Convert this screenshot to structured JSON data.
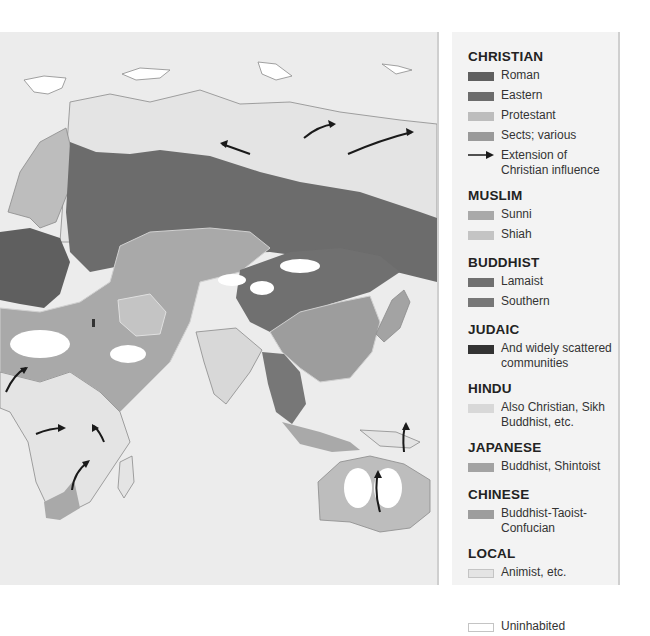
{
  "map": {
    "colors": {
      "ocean": "#ececec",
      "roman": "#5f5f5f",
      "eastern": "#6c6c6c",
      "protestant": "#bdbdbd",
      "sects": "#9a9a9a",
      "sunni": "#a9a9a9",
      "shiah": "#c4c4c4",
      "lamaist": "#707070",
      "southern": "#777777",
      "judaic": "#333333",
      "hindu": "#d8d8d8",
      "japanese": "#a3a3a3",
      "chinese": "#9d9d9d",
      "local": "#e4e4e4",
      "uninhabited": "#ffffff",
      "coast": "#8a8a8a",
      "arrow": "#1a1a1a"
    }
  },
  "legend": {
    "groups": [
      {
        "title": "CHRISTIAN",
        "items": [
          {
            "label": "Roman",
            "color": "#5f5f5f"
          },
          {
            "label": "Eastern",
            "color": "#6c6c6c"
          },
          {
            "label": "Protestant",
            "color": "#bdbdbd"
          },
          {
            "label": "Sects; various",
            "color": "#9a9a9a"
          },
          {
            "label": "Extension of Christian influence",
            "symbol": "arrow"
          }
        ]
      },
      {
        "title": "MUSLIM",
        "items": [
          {
            "label": "Sunni",
            "color": "#a9a9a9"
          },
          {
            "label": "Shiah",
            "color": "#c4c4c4"
          }
        ]
      },
      {
        "title": "BUDDHIST",
        "items": [
          {
            "label": "Lamaist",
            "color": "#707070"
          },
          {
            "label": "Southern",
            "color": "#777777"
          }
        ]
      },
      {
        "title": "JUDAIC",
        "items": [
          {
            "label": "And widely scattered communities",
            "color": "#333333"
          }
        ]
      },
      {
        "title": "HINDU",
        "items": [
          {
            "label": "Also Christian, Sikh Buddhist, etc.",
            "color": "#d8d8d8"
          }
        ]
      },
      {
        "title": "JAPANESE",
        "items": [
          {
            "label": "Buddhist, Shintoist",
            "color": "#a3a3a3"
          }
        ]
      },
      {
        "title": "CHINESE",
        "items": [
          {
            "label": "Buddhist-Taoist-Confucian",
            "color": "#9d9d9d"
          }
        ]
      },
      {
        "title": "LOCAL",
        "items": [
          {
            "label": "Animist, etc.",
            "color": "#e4e4e4"
          }
        ]
      }
    ],
    "uninhabited": {
      "label": "Uninhabited",
      "color": "#ffffff"
    }
  }
}
